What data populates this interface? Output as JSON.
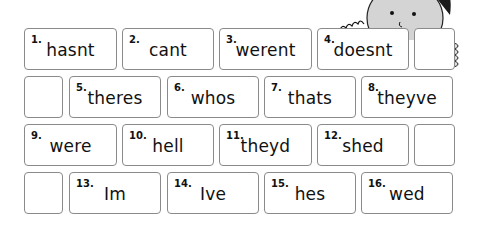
{
  "worksheet": {
    "rows": [
      {
        "cells": [
          {
            "number": "1.",
            "word": "hasnt"
          },
          {
            "number": "2.",
            "word": "cant"
          },
          {
            "number": "3.",
            "word": "werent"
          },
          {
            "number": "4.",
            "word": "doesnt"
          },
          {
            "blank": true
          }
        ]
      },
      {
        "cells": [
          {
            "blank": true
          },
          {
            "number": "5.",
            "word": "theres"
          },
          {
            "number": "6.",
            "word": "whos"
          },
          {
            "number": "7.",
            "word": "thats"
          },
          {
            "number": "8.",
            "word": "theyve"
          }
        ]
      },
      {
        "cells": [
          {
            "number": "9.",
            "word": "were"
          },
          {
            "number": "10.",
            "word": "hell"
          },
          {
            "number": "11.",
            "word": "theyd"
          },
          {
            "number": "12.",
            "word": "shed"
          },
          {
            "blank": true
          }
        ]
      },
      {
        "cells": [
          {
            "blank": true
          },
          {
            "number": "13.",
            "word": "Im"
          },
          {
            "number": "14.",
            "word": "Ive"
          },
          {
            "number": "15.",
            "word": "hes"
          },
          {
            "number": "16.",
            "word": "wed"
          }
        ]
      }
    ]
  },
  "illustration": {
    "icon": "cartoon-child-peeking-icon"
  },
  "colors": {
    "border": "#8a8a8a",
    "text": "#111111",
    "hair": "#1a1a1a",
    "skin": "#d9d9d9"
  }
}
